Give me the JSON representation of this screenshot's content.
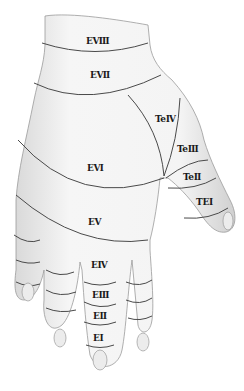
{
  "figure": {
    "colors": {
      "skin": "#f2f2f2",
      "shade": "#c8c8c8",
      "outline": "#8a8a8a",
      "zone_line": "#4a4a4a",
      "label": "#1a1a1a"
    },
    "zones": [
      {
        "id": "e8",
        "label": "EⅧ",
        "x": 86,
        "y": 36
      },
      {
        "id": "e7",
        "label": "EⅦ",
        "x": 90,
        "y": 70
      },
      {
        "id": "te4",
        "label": "TeⅣ",
        "x": 155,
        "y": 114
      },
      {
        "id": "te3",
        "label": "TeⅢ",
        "x": 177,
        "y": 144
      },
      {
        "id": "te2",
        "label": "TeⅡ",
        "x": 183,
        "y": 172
      },
      {
        "id": "te1",
        "label": "TEⅠ",
        "x": 196,
        "y": 197
      },
      {
        "id": "e6",
        "label": "EⅥ",
        "x": 87,
        "y": 163
      },
      {
        "id": "e5",
        "label": "EⅤ",
        "x": 88,
        "y": 217
      },
      {
        "id": "e4",
        "label": "EⅣ",
        "x": 91,
        "y": 260
      },
      {
        "id": "e3",
        "label": "EⅢ",
        "x": 92,
        "y": 290
      },
      {
        "id": "e2",
        "label": "EⅡ",
        "x": 93,
        "y": 311
      },
      {
        "id": "e1",
        "label": "EⅠ",
        "x": 93,
        "y": 333
      }
    ]
  }
}
